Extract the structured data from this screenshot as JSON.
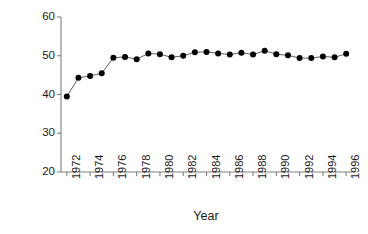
{
  "chart_data": {
    "type": "line",
    "title": "",
    "xlabel": "Year",
    "ylabel": "% of Model Act benefits",
    "xlim": [
      1971.5,
      1996.5
    ],
    "ylim": [
      20,
      60
    ],
    "yticks": [
      20,
      30,
      40,
      50,
      60
    ],
    "xticks": [
      1972,
      1974,
      1976,
      1978,
      1980,
      1982,
      1984,
      1986,
      1988,
      1990,
      1992,
      1994,
      1996
    ],
    "xtick_labels": [
      "1972",
      "1974",
      "1976",
      "1978",
      "1980",
      "1982",
      "1984",
      "1986",
      "1988",
      "1990",
      "1992",
      "1994",
      "1996"
    ],
    "ytick_labels": [
      "20",
      "30",
      "40",
      "50",
      "60"
    ],
    "grid": false,
    "legend": null,
    "marker": "filled-circle",
    "marker_color": "#000000",
    "line_color": "#4d4d4d",
    "axis_color": "#808080",
    "x": [
      1972,
      1973,
      1974,
      1975,
      1976,
      1977,
      1978,
      1979,
      1980,
      1981,
      1982,
      1983,
      1984,
      1985,
      1986,
      1987,
      1988,
      1989,
      1990,
      1991,
      1992,
      1993,
      1994,
      1995,
      1996
    ],
    "values": [
      39.5,
      44.3,
      44.8,
      45.5,
      49.5,
      49.7,
      49.1,
      50.6,
      50.4,
      49.6,
      50.0,
      50.9,
      51.0,
      50.6,
      50.3,
      50.8,
      50.3,
      51.3,
      50.4,
      50.1,
      49.4,
      49.4,
      49.8,
      49.6,
      50.5
    ],
    "series": [
      {
        "name": "% of Model Act benefits",
        "values": [
          39.5,
          44.3,
          44.8,
          45.5,
          49.5,
          49.7,
          49.1,
          50.6,
          50.4,
          49.6,
          50.0,
          50.9,
          51.0,
          50.6,
          50.3,
          50.8,
          50.3,
          51.3,
          50.4,
          50.1,
          49.4,
          49.4,
          49.8,
          49.6,
          50.5
        ]
      }
    ]
  }
}
